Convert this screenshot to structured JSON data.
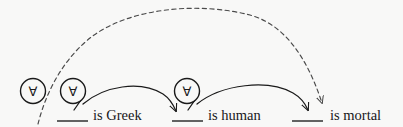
{
  "diagram": {
    "background_color": "#f8f8f7",
    "ink_color": "#1a1a1a",
    "quantifiers": [
      {
        "id": "q1",
        "symbol": "∀",
        "name": "outer-universal-quantifier",
        "cx": 33,
        "cy": 91,
        "r": 12.5,
        "has_tail": false
      },
      {
        "id": "q2",
        "symbol": "∀",
        "name": "greek-universal-quantifier",
        "cx": 73,
        "cy": 91,
        "r": 12.5,
        "has_tail": true
      },
      {
        "id": "q3",
        "symbol": "∀",
        "name": "human-universal-quantifier",
        "cx": 187,
        "cy": 91,
        "r": 12.5,
        "has_tail": true
      }
    ],
    "predicates": [
      {
        "id": "p1",
        "name": "is-greek",
        "blank_label": "___",
        "text": "is Greek",
        "blank_x1": 57,
        "blank_x2": 88,
        "text_x": 93,
        "baseline_y": 120
      },
      {
        "id": "p2",
        "name": "is-human",
        "blank_label": "___",
        "text": "is human",
        "blank_x1": 172,
        "blank_x2": 203,
        "text_x": 208,
        "baseline_y": 120
      },
      {
        "id": "p3",
        "name": "is-mortal",
        "blank_label": "___",
        "text": "is mortal",
        "blank_x1": 292,
        "blank_x2": 323,
        "text_x": 330,
        "baseline_y": 120
      }
    ],
    "arcs": [
      {
        "id": "a1",
        "name": "greek-to-human-arc",
        "style": "solid",
        "from": "q2-tail",
        "to": "is-human-blank",
        "arrowhead": true
      },
      {
        "id": "a2",
        "name": "human-to-mortal-arc",
        "style": "solid",
        "from": "q3-tail",
        "to": "is-mortal-blank",
        "arrowhead": true
      },
      {
        "id": "a3",
        "name": "greek-to-mortal-dashed-arc",
        "style": "dashed",
        "from": "lower-left-origin",
        "to": "is-mortal-blank",
        "arrowhead": true
      }
    ]
  }
}
